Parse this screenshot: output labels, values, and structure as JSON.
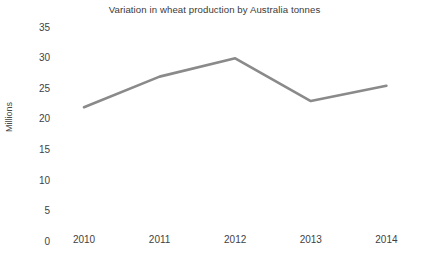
{
  "chart_data": {
    "type": "line",
    "title": "Variation in wheat production by Australia tonnes",
    "xlabel": "",
    "ylabel": "Millions",
    "categories": [
      "2010",
      "2011",
      "2012",
      "2013",
      "2014"
    ],
    "values": [
      22,
      27,
      30,
      23,
      25.5
    ],
    "series": [
      {
        "name": "Wheat production",
        "values": [
          22,
          27,
          30,
          23,
          25.5
        ]
      }
    ],
    "ylim": [
      0,
      35
    ],
    "yticks": [
      0,
      5,
      10,
      15,
      20,
      25,
      30,
      35
    ],
    "ytick_labels": [
      "0",
      "5",
      "10",
      "15",
      "20",
      "25",
      "30",
      "35"
    ],
    "xtick_labels": [
      "2010",
      "2011",
      "2012",
      "2013",
      "2014"
    ],
    "grid": true,
    "grid_axis": "y",
    "legend": false,
    "legend_position": "none",
    "markers": false,
    "colors": {
      "line": "#8a8a8a",
      "grid": "#ebebeb",
      "text": "#3f3f3f",
      "title": "#3a3a3a",
      "background": "#ffffff"
    },
    "line_width": 2.6
  }
}
